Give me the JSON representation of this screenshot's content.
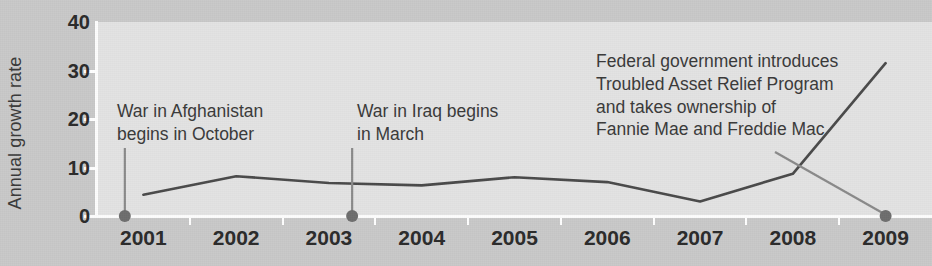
{
  "chart_data": {
    "type": "line",
    "title": "",
    "xlabel": "",
    "ylabel": "Annual growth rate",
    "categories": [
      "2001",
      "2002",
      "2003",
      "2004",
      "2005",
      "2006",
      "2007",
      "2008",
      "2009"
    ],
    "x": [
      2001,
      2002,
      2003,
      2004,
      2005,
      2006,
      2007,
      2008,
      2009
    ],
    "values": [
      4.4,
      8.2,
      6.8,
      6.3,
      8.0,
      7.0,
      3.0,
      8.7,
      31.5
    ],
    "series": [
      {
        "name": "Annual growth rate",
        "values": [
          4.4,
          8.2,
          6.8,
          6.3,
          8.0,
          7.0,
          3.0,
          8.7,
          31.5
        ]
      }
    ],
    "ylim": [
      0,
      40
    ],
    "yticks": [
      0,
      10,
      20,
      30,
      40
    ],
    "ytick_labels": [
      "0",
      "10",
      "20",
      "30",
      "40"
    ],
    "grid": "vertical",
    "legend": "none",
    "line_color": "#4a4a4a",
    "plot_background": "#e3e3e3",
    "figure_background": "#c9c9c9",
    "annotations": [
      {
        "id": "afghanistan",
        "text": "War in Afghanistan\nbegins in October",
        "x": 2000.8,
        "y": 0,
        "marker": true
      },
      {
        "id": "iraq",
        "text": "War in Iraq begins\nin March",
        "x": 2003.25,
        "y": 0,
        "marker": true
      },
      {
        "id": "tarp",
        "text": "Federal government introduces\nTroubled Asset Relief Program\nand takes ownership of\nFannie Mae and Freddie Mac",
        "x": 2009,
        "y": 0,
        "marker": true
      }
    ]
  },
  "axis": {
    "y_title": "Annual growth rate",
    "y_ticks": [
      "40",
      "30",
      "20",
      "10",
      "0"
    ],
    "x_ticks": [
      "2001",
      "2002",
      "2003",
      "2004",
      "2005",
      "2006",
      "2007",
      "2008",
      "2009"
    ]
  },
  "annotations": {
    "afghanistan": {
      "line1": "War in Afghanistan",
      "line2": "begins in October"
    },
    "iraq": {
      "line1": "War in Iraq begins",
      "line2": "in March"
    },
    "tarp": {
      "line1": "Federal government introduces",
      "line2": "Troubled Asset Relief Program",
      "line3": "and takes ownership of",
      "line4": "Fannie Mae and Freddie Mac"
    }
  },
  "colors": {
    "line": "#4a4a4a",
    "marker": "#6e6e6e",
    "text": "#3a3a3a",
    "tick_text": "#2b2b2b",
    "plot_bg": "#e3e3e3",
    "fig_bg": "#c9c9c9",
    "gridline": "#fbfbfb"
  }
}
